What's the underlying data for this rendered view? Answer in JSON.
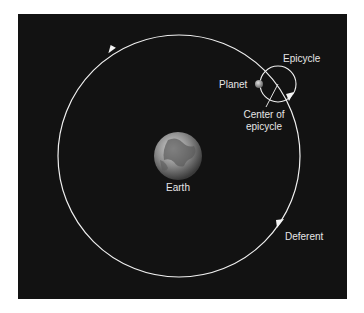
{
  "diagram": {
    "colors": {
      "background": "#121212",
      "lines": "#f0f0f0",
      "text": "#e6e6e6",
      "page": "#ffffff"
    },
    "labels": {
      "epicycle": "Epicycle",
      "planet": "Planet",
      "center_line1": "Center of",
      "center_line2": "epicycle",
      "earth": "Earth",
      "deferent": "Deferent"
    }
  }
}
